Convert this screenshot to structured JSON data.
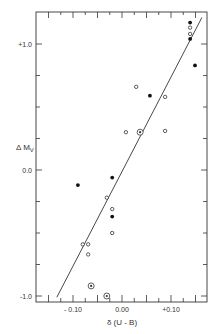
{
  "chart_data": {
    "type": "scatter",
    "title": "",
    "xlabel": "δ (U - B)",
    "ylabel": "Δ M_V",
    "xlim": [
      -0.175,
      0.175
    ],
    "ylim": [
      -1.05,
      1.25
    ],
    "x_ticks": [
      -0.1,
      0.0,
      0.1
    ],
    "x_tick_labels": [
      "- 0.10",
      "0.00",
      "+0.10"
    ],
    "y_ticks": [
      -1.0,
      0.0,
      1.0
    ],
    "y_tick_labels": [
      "-1.0",
      "0.0",
      "+1.0"
    ],
    "grid": false,
    "legend": null,
    "series": [
      {
        "name": "filled",
        "marker": "filled-circle",
        "points": [
          [
            0.139,
            1.17
          ],
          [
            0.139,
            1.04
          ],
          [
            0.149,
            0.83
          ],
          [
            0.057,
            0.59
          ],
          [
            -0.02,
            -0.06
          ],
          [
            -0.09,
            -0.12
          ],
          [
            -0.02,
            -0.37
          ]
        ]
      },
      {
        "name": "open",
        "marker": "open-circle",
        "points": [
          [
            0.139,
            1.13
          ],
          [
            0.139,
            1.08
          ],
          [
            0.029,
            0.66
          ],
          [
            0.088,
            0.58
          ],
          [
            0.008,
            0.3
          ],
          [
            0.088,
            0.31
          ],
          [
            -0.031,
            -0.22
          ],
          [
            -0.02,
            -0.31
          ],
          [
            -0.02,
            -0.5
          ],
          [
            -0.08,
            -0.59
          ],
          [
            -0.069,
            -0.59
          ],
          [
            -0.069,
            -0.67
          ]
        ]
      },
      {
        "name": "circled-dot",
        "marker": "circled-dot",
        "points": [
          [
            0.037,
            0.3
          ],
          [
            -0.063,
            -0.92
          ],
          [
            -0.031,
            -1.0
          ]
        ]
      }
    ],
    "fit_line": {
      "x": [
        -0.133,
        0.163
      ],
      "y": [
        -1.01,
        1.21
      ]
    }
  },
  "axes": {
    "x_label": "δ (U - B)",
    "y_label": "Δ M",
    "y_label_sub": "V"
  }
}
